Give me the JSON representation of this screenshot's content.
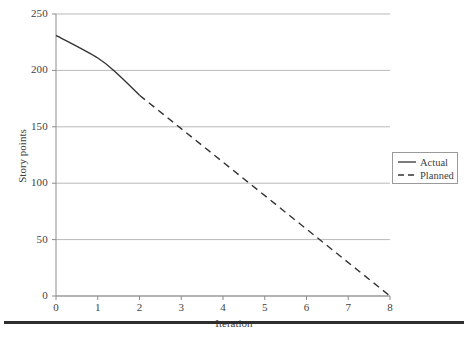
{
  "chart_data": {
    "type": "line",
    "title": "",
    "xlabel": "Iteration",
    "ylabel": "Story points",
    "xlim": [
      0,
      8
    ],
    "ylim": [
      0,
      250
    ],
    "xticks": [
      0,
      1,
      2,
      3,
      4,
      5,
      6,
      7,
      8
    ],
    "yticks": [
      0,
      50,
      100,
      150,
      200,
      250
    ],
    "xtick_labels": [
      "0",
      "1",
      "2",
      "3",
      "4",
      "5",
      "6",
      "7",
      "8"
    ],
    "ytick_labels": [
      "0",
      "50",
      "100",
      "150",
      "200",
      "250"
    ],
    "grid": "horizontal",
    "legend_position": "right",
    "series": [
      {
        "name": "Actual",
        "style": "solid",
        "color": "#333333",
        "x": [
          0,
          1,
          1.5,
          2
        ],
        "values": [
          231,
          211,
          196,
          178
        ]
      },
      {
        "name": "Planned",
        "style": "dashed",
        "color": "#333333",
        "x": [
          2,
          8
        ],
        "values": [
          178,
          0
        ]
      }
    ]
  },
  "legend": {
    "items": [
      {
        "label": "Actual",
        "style": "solid"
      },
      {
        "label": "Planned",
        "style": "dashed"
      }
    ]
  },
  "colors": {
    "grid": "#b9b9b9",
    "axis": "#8c8c8c",
    "line": "#333333",
    "text": "#3f3f3f",
    "rule": "#2e2e2e"
  }
}
